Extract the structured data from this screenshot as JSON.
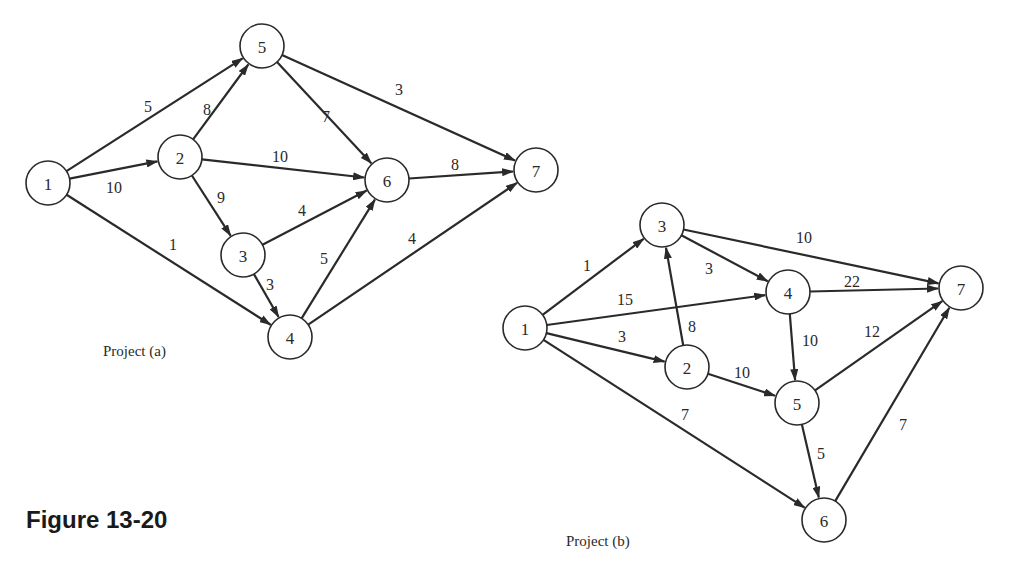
{
  "figure": {
    "title": "Figure 13-20",
    "node_radius": 22,
    "colors": {
      "stroke": "#2a2a2a",
      "text": "#2a2a2a",
      "background": "#ffffff"
    }
  },
  "projects": [
    {
      "id": "a",
      "caption": "Project (a)",
      "caption_pos": [
        103,
        356
      ],
      "nodes": [
        {
          "id": "1",
          "x": 48,
          "y": 183
        },
        {
          "id": "2",
          "x": 180,
          "y": 157
        },
        {
          "id": "3",
          "x": 243,
          "y": 255
        },
        {
          "id": "4",
          "x": 290,
          "y": 337
        },
        {
          "id": "5",
          "x": 262,
          "y": 46
        },
        {
          "id": "6",
          "x": 387,
          "y": 180
        },
        {
          "id": "7",
          "x": 536,
          "y": 170
        }
      ],
      "edges": [
        {
          "from": "1",
          "to": "5",
          "label": "5",
          "lx": 148,
          "ly": 106
        },
        {
          "from": "1",
          "to": "2",
          "label": "10",
          "lx": 114,
          "ly": 187
        },
        {
          "from": "1",
          "to": "4",
          "label": "1",
          "lx": 173,
          "ly": 244
        },
        {
          "from": "2",
          "to": "5",
          "label": "8",
          "lx": 207,
          "ly": 109
        },
        {
          "from": "2",
          "to": "6",
          "label": "10",
          "lx": 280,
          "ly": 156
        },
        {
          "from": "2",
          "to": "3",
          "label": "9",
          "lx": 221,
          "ly": 197
        },
        {
          "from": "5",
          "to": "6",
          "label": "7",
          "lx": 326,
          "ly": 116
        },
        {
          "from": "5",
          "to": "7",
          "label": "3",
          "lx": 399,
          "ly": 89
        },
        {
          "from": "6",
          "to": "7",
          "label": "8",
          "lx": 455,
          "ly": 164
        },
        {
          "from": "3",
          "to": "6",
          "label": "4",
          "lx": 302,
          "ly": 210
        },
        {
          "from": "3",
          "to": "4",
          "label": "3",
          "lx": 270,
          "ly": 284
        },
        {
          "from": "4",
          "to": "6",
          "label": "5",
          "lx": 324,
          "ly": 258
        },
        {
          "from": "4",
          "to": "7",
          "label": "4",
          "lx": 412,
          "ly": 238
        }
      ]
    },
    {
      "id": "b",
      "caption": "Project (b)",
      "caption_pos": [
        566,
        546
      ],
      "nodes": [
        {
          "id": "1",
          "x": 525,
          "y": 328
        },
        {
          "id": "2",
          "x": 687,
          "y": 367
        },
        {
          "id": "3",
          "x": 662,
          "y": 225
        },
        {
          "id": "4",
          "x": 788,
          "y": 292
        },
        {
          "id": "5",
          "x": 797,
          "y": 403
        },
        {
          "id": "6",
          "x": 824,
          "y": 520
        },
        {
          "id": "7",
          "x": 961,
          "y": 288
        }
      ],
      "edges": [
        {
          "from": "1",
          "to": "3",
          "label": "1",
          "lx": 587,
          "ly": 265
        },
        {
          "from": "1",
          "to": "4",
          "label": "15",
          "lx": 625,
          "ly": 299
        },
        {
          "from": "1",
          "to": "2",
          "label": "3",
          "lx": 622,
          "ly": 336
        },
        {
          "from": "1",
          "to": "6",
          "label": "7",
          "lx": 685,
          "ly": 414
        },
        {
          "from": "2",
          "to": "3",
          "label": "8",
          "lx": 692,
          "ly": 326
        },
        {
          "from": "3",
          "to": "4",
          "label": "3",
          "lx": 709,
          "ly": 268
        },
        {
          "from": "3",
          "to": "7",
          "label": "10",
          "lx": 804,
          "ly": 237
        },
        {
          "from": "4",
          "to": "7",
          "label": "22",
          "lx": 852,
          "ly": 281
        },
        {
          "from": "4",
          "to": "5",
          "label": "10",
          "lx": 810,
          "ly": 340
        },
        {
          "from": "2",
          "to": "5",
          "label": "10",
          "lx": 742,
          "ly": 372
        },
        {
          "from": "5",
          "to": "7",
          "label": "12",
          "lx": 872,
          "ly": 331
        },
        {
          "from": "5",
          "to": "6",
          "label": "5",
          "lx": 821,
          "ly": 453
        },
        {
          "from": "6",
          "to": "7",
          "label": "7",
          "lx": 903,
          "ly": 424
        }
      ]
    }
  ]
}
